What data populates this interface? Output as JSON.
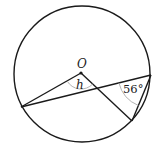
{
  "diagram": {
    "type": "circle-geometry",
    "circle": {
      "cx": 82,
      "cy": 74,
      "r": 68,
      "stroke": "#1a1a1a"
    },
    "center_label": "O",
    "points": {
      "O": [
        81,
        73
      ],
      "A": [
        21,
        107
      ],
      "B": [
        151,
        75
      ],
      "C": [
        132,
        121
      ]
    },
    "segments": [
      {
        "from": "A",
        "to": "O"
      },
      {
        "from": "O",
        "to": "C"
      },
      {
        "from": "A",
        "to": "B"
      },
      {
        "from": "B",
        "to": "C"
      }
    ],
    "angle_labels": {
      "center_angle": "h",
      "inscribed_angle": "56°"
    },
    "arc_color": "#aaaaaa"
  }
}
